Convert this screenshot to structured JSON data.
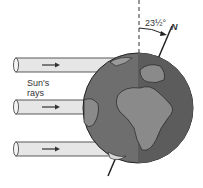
{
  "diagram": {
    "rays_label_line1": "Sun's",
    "rays_label_line2": "rays",
    "angle_label": "23½°",
    "north_label": "N",
    "colors": {
      "globe_land": "#8a8a8a",
      "globe_ocean": "#6a6a6a",
      "ray_fill": "#e6e6e6",
      "outline": "#222222"
    }
  }
}
